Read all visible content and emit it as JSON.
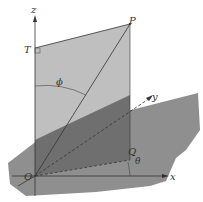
{
  "figure": {
    "labels": {
      "z_axis": "z",
      "y_axis": "y",
      "x_axis": "x",
      "origin": "O",
      "point_P": "P",
      "point_T": "T",
      "point_Q": "Q",
      "angle_phi": "ϕ",
      "angle_theta": "θ"
    },
    "colors": {
      "background": "#ffffff",
      "horizontal_plane": "#8f8f8f",
      "vertical_plane": "#b9b9b9",
      "overlap_region": "#6e6e6e",
      "lines": "#333333"
    }
  }
}
